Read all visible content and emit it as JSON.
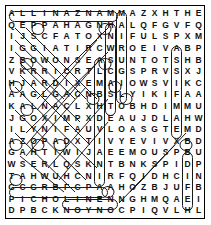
{
  "puzzle": {
    "type": "word-search",
    "rows": 18,
    "cols": 18,
    "grid": [
      [
        "A",
        "L",
        "L",
        "I",
        "N",
        "A",
        "Z",
        "N",
        "A",
        "M",
        "M",
        "A",
        "Z",
        "X",
        "H",
        "T",
        "H",
        "E"
      ],
      [
        "Q",
        "E",
        "P",
        "P",
        "A",
        "H",
        "A",
        "G",
        "N",
        "H",
        "A",
        "L",
        "Q",
        "F",
        "G",
        "V",
        "F",
        "Q"
      ],
      [
        "I",
        "J",
        "S",
        "C",
        "F",
        "A",
        "T",
        "O",
        "X",
        "N",
        "I",
        "F",
        "U",
        "L",
        "S",
        "P",
        "X",
        "M"
      ],
      [
        "I",
        "G",
        "G",
        "I",
        "A",
        "T",
        "I",
        "R",
        "C",
        "W",
        "R",
        "O",
        "E",
        "I",
        "V",
        "A",
        "B",
        "P"
      ],
      [
        "Z",
        "B",
        "O",
        "W",
        "O",
        "N",
        "S",
        "E",
        "A",
        "S",
        "U",
        "N",
        "T",
        "O",
        "T",
        "S",
        "H",
        "B"
      ],
      [
        "V",
        "K",
        "R",
        "R",
        "I",
        "C",
        "R",
        "T",
        "L",
        "C",
        "G",
        "S",
        "P",
        "R",
        "V",
        "S",
        "X",
        "J"
      ],
      [
        "H",
        "J",
        "A",
        "R",
        "D",
        "I",
        "X",
        "E",
        "M",
        "A",
        "I",
        "O",
        "W",
        "S",
        "V",
        "I",
        "K",
        "C"
      ],
      [
        "A",
        "A",
        "G",
        "L",
        "G",
        "A",
        "C",
        "N",
        "B",
        "S",
        "L",
        "Y",
        "I",
        "K",
        "I",
        "F",
        "A",
        "A"
      ],
      [
        "K",
        "A",
        "L",
        "N",
        "A",
        "C",
        "L",
        "X",
        "H",
        "T",
        "O",
        "B",
        "H",
        "D",
        "I",
        "M",
        "M",
        "U"
      ],
      [
        "J",
        "G",
        "O",
        "X",
        "I",
        "M",
        "P",
        "X",
        "D",
        "E",
        "A",
        "U",
        "J",
        "D",
        "L",
        "A",
        "H",
        "W"
      ],
      [
        "I",
        "L",
        "Y",
        "N",
        "I",
        "F",
        "A",
        "U",
        "V",
        "L",
        "O",
        "A",
        "S",
        "G",
        "T",
        "E",
        "M",
        "D"
      ],
      [
        "A",
        "Z",
        "O",
        "P",
        "A",
        "D",
        "X",
        "T",
        "I",
        "V",
        "Y",
        "E",
        "V",
        "I",
        "V",
        "X",
        "B",
        "D"
      ],
      [
        "G",
        "A",
        "H",
        "T",
        "I",
        "W",
        "I",
        "J",
        "A",
        "E",
        "E",
        "M",
        "O",
        "U",
        "S",
        "P",
        "B",
        "U"
      ],
      [
        "W",
        "S",
        "E",
        "R",
        "L",
        "Q",
        "S",
        "K",
        "N",
        "T",
        "B",
        "N",
        "K",
        "S",
        "P",
        "I",
        "D",
        "P"
      ],
      [
        "T",
        "A",
        "H",
        "W",
        "U",
        "H",
        "C",
        "N",
        "I",
        "R",
        "F",
        "Q",
        "I",
        "D",
        "H",
        "C",
        "I",
        "N"
      ],
      [
        "G",
        "C",
        "G",
        "R",
        "B",
        "F",
        "C",
        "P",
        "A",
        "A",
        "H",
        "O",
        "Z",
        "B",
        "J",
        "U",
        "F",
        "B"
      ],
      [
        "P",
        "I",
        "C",
        "H",
        "O",
        "L",
        "I",
        "N",
        "E",
        "N",
        "N",
        "G",
        "H",
        "M",
        "Q",
        "A",
        "E",
        "I"
      ],
      [
        "D",
        "P",
        "B",
        "C",
        "K",
        "N",
        "O",
        "Y",
        "N",
        "O",
        "C",
        "P",
        "I",
        "Q",
        "V",
        "L",
        "H",
        "L"
      ]
    ],
    "found_words": [
      {
        "word": "MANZANILLA",
        "direction": "horizontal-reversed",
        "row": 1,
        "start_col": 10,
        "end_col": 1
      },
      {
        "word": "PICHOLINE",
        "direction": "horizontal",
        "row": 17,
        "start_col": 1,
        "end_col": 9
      },
      {
        "word": "ALFONSO",
        "direction": "vertical",
        "col": 12,
        "start_row": 1,
        "end_row": 7
      },
      {
        "word": "NOYON",
        "direction": "horizontal-reversed",
        "row": 18,
        "start_col": 10,
        "end_col": 6
      }
    ],
    "colors": {
      "ink": "#111111",
      "mark": "#1a1a1a",
      "background": "#ffffff",
      "border": "#000000"
    }
  }
}
